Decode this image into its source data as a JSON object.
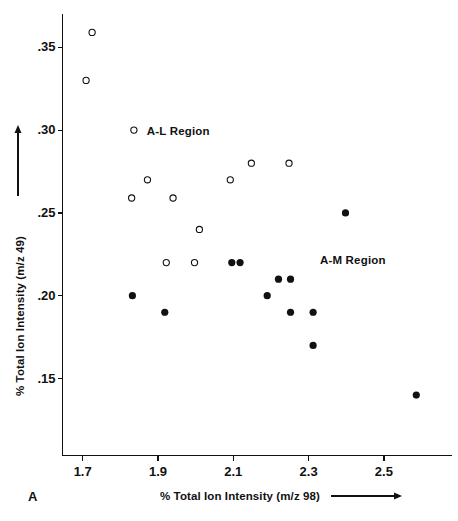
{
  "figure": {
    "panel_label": "A",
    "background_color": "#ffffff",
    "ink_color": "#111111"
  },
  "chart_data": {
    "type": "scatter",
    "title": "",
    "xlabel": "% Total Ion Intensity (m/z 98)",
    "ylabel": "% Total Ion Intensity (m/z 49)",
    "xlim": [
      1.63,
      2.67
    ],
    "ylim": [
      0.128,
      0.372
    ],
    "xticks": [
      "1.7",
      "1.9",
      "2.1",
      "2.3",
      "2.5"
    ],
    "xtick_values": [
      1.7,
      1.9,
      2.1,
      2.3,
      2.5
    ],
    "yticks": [
      ".35",
      ".30",
      ".25",
      ".20",
      ".15"
    ],
    "ytick_values": [
      0.35,
      0.3,
      0.25,
      0.2,
      0.15
    ],
    "grid": false,
    "legend_position": "none",
    "annotations": [
      {
        "text": "A-L Region",
        "x": 1.87,
        "y": 0.299
      },
      {
        "text": "A-M Region",
        "x": 2.33,
        "y": 0.221
      },
      {
        "text": "A",
        "x": 1.655,
        "y": 0.129
      }
    ],
    "series": [
      {
        "name": "A-L Region",
        "marker": "open-circle",
        "color": "#111111",
        "fill": "none",
        "points": [
          {
            "x": 1.725,
            "y": 0.359
          },
          {
            "x": 1.709,
            "y": 0.33
          },
          {
            "x": 1.836,
            "y": 0.3
          },
          {
            "x": 1.872,
            "y": 0.27
          },
          {
            "x": 1.83,
            "y": 0.259
          },
          {
            "x": 1.94,
            "y": 0.259
          },
          {
            "x": 2.092,
            "y": 0.27
          },
          {
            "x": 2.148,
            "y": 0.28
          },
          {
            "x": 2.248,
            "y": 0.28
          },
          {
            "x": 2.01,
            "y": 0.24
          },
          {
            "x": 1.922,
            "y": 0.22
          },
          {
            "x": 1.997,
            "y": 0.22
          }
        ]
      },
      {
        "name": "A-M Region",
        "marker": "filled-circle",
        "color": "#111111",
        "fill": "#111111",
        "points": [
          {
            "x": 1.832,
            "y": 0.2
          },
          {
            "x": 1.918,
            "y": 0.19
          },
          {
            "x": 2.096,
            "y": 0.22
          },
          {
            "x": 2.118,
            "y": 0.22
          },
          {
            "x": 2.19,
            "y": 0.2
          },
          {
            "x": 2.22,
            "y": 0.21
          },
          {
            "x": 2.252,
            "y": 0.21
          },
          {
            "x": 2.252,
            "y": 0.19
          },
          {
            "x": 2.312,
            "y": 0.19
          },
          {
            "x": 2.312,
            "y": 0.17
          },
          {
            "x": 2.398,
            "y": 0.25
          },
          {
            "x": 2.586,
            "y": 0.14
          }
        ]
      }
    ]
  }
}
